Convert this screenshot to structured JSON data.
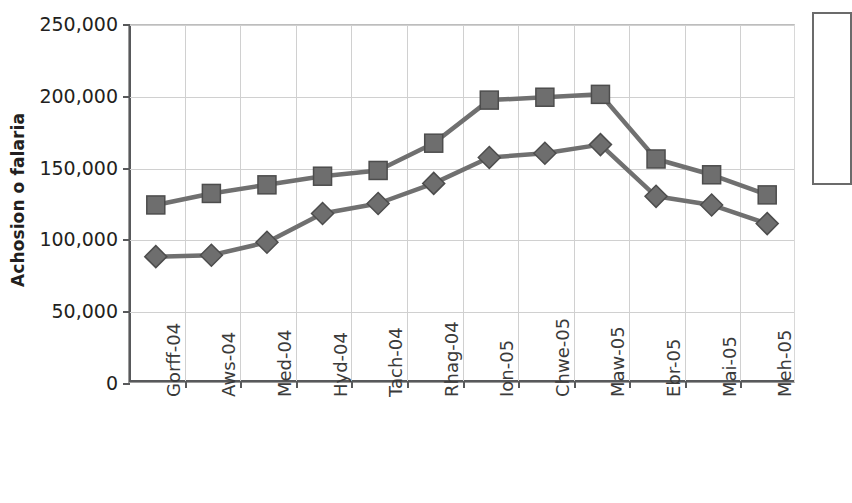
{
  "chart_data": {
    "type": "line",
    "title": "",
    "xlabel": "",
    "ylabel": "Achosion o falaria",
    "ylim": [
      0,
      250000
    ],
    "ytick_values": [
      250000,
      200000,
      150000,
      100000,
      50000,
      0
    ],
    "ytick_labels": [
      "250,000",
      "200,000",
      "150,000",
      "100,000",
      "50,000",
      "0"
    ],
    "grid": true,
    "legend_position": "right",
    "categories": [
      "Gorff-04",
      "Aws-04",
      "Med-04",
      "Hyd-04",
      "Tach-04",
      "Rhag-04",
      "Ion-05",
      "Chwe-05",
      "Maw-05",
      "Ebr-05",
      "Mai-05",
      "Meh-05"
    ],
    "series": [
      {
        "name": "series-squares",
        "marker": "square",
        "color": "#6e6e6e",
        "values": [
          124000,
          132000,
          138000,
          144000,
          148000,
          167000,
          197000,
          199000,
          201000,
          156000,
          145000,
          131000
        ]
      },
      {
        "name": "series-diamonds",
        "marker": "diamond",
        "color": "#6e6e6e",
        "values": [
          88000,
          89000,
          98000,
          118000,
          125000,
          139000,
          157000,
          160000,
          166000,
          130000,
          124000,
          111000
        ]
      }
    ]
  },
  "colors": {
    "marker": "#6e6e6e",
    "marker_stroke": "#4d4d4d",
    "line": "#707070",
    "gridline": "#d0d0d0",
    "axis": "#58595b",
    "text": "#231f20",
    "tick_text": "#3a3a3a",
    "legend_border": "#6b6b6b"
  }
}
